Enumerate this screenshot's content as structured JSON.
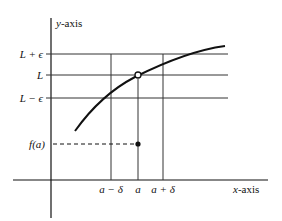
{
  "diagram": {
    "axes": {
      "y_label": "y-axis",
      "x_label": "x-axis"
    },
    "y_levels": [
      {
        "id": "L-plus-eps",
        "label": "L + ϵ"
      },
      {
        "id": "L",
        "label": "L"
      },
      {
        "id": "L-minus-eps",
        "label": "L − ϵ"
      },
      {
        "id": "f-a",
        "label": "f(a)"
      }
    ],
    "x_levels": [
      {
        "id": "a-minus-delta",
        "label": "a − δ"
      },
      {
        "id": "a",
        "label": "a"
      },
      {
        "id": "a-plus-delta",
        "label": "a + δ"
      }
    ],
    "points": {
      "open_circle": "(a, L) excluded",
      "filled_dot": "(a, f(a))"
    },
    "colors": {
      "line": "#111111",
      "grid": "#333333",
      "background": "#ffffff"
    }
  }
}
